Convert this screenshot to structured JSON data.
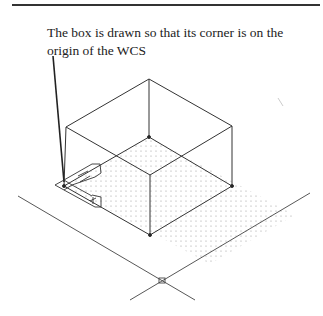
{
  "caption": {
    "line1": "The box is drawn so that its corner is on the",
    "line2": "origin of the WCS"
  },
  "figure": {
    "colors": {
      "line": "#333333",
      "grid_dot": "#999999",
      "rule": "#333333"
    }
  }
}
